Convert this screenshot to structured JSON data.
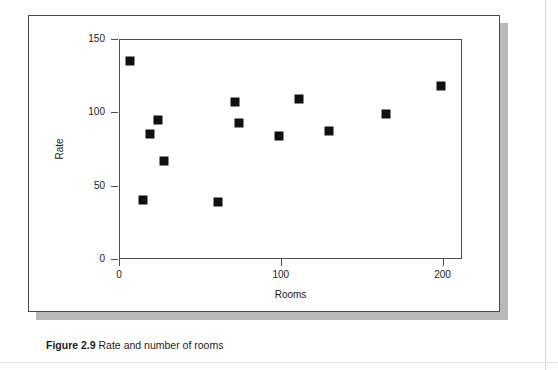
{
  "figure": {
    "caption_label": "Figure 2.9",
    "caption_text": "Rate and number of rooms"
  },
  "chart_data": {
    "type": "scatter",
    "title": "",
    "xlabel": "Rooms",
    "ylabel": "Rate",
    "xlim": [
      0,
      212
    ],
    "ylim": [
      0,
      150
    ],
    "xticks": [
      0,
      100,
      200
    ],
    "yticks": [
      0,
      50,
      100,
      150
    ],
    "xtick_labels": [
      "0",
      "100",
      "200"
    ],
    "ytick_labels": [
      "0",
      "50",
      "100",
      "150"
    ],
    "grid": false,
    "legend": null,
    "marker": "filled-square",
    "marker_color": "#111111",
    "series": [
      {
        "name": "hotels",
        "points": [
          {
            "x": 7,
            "y": 135
          },
          {
            "x": 15,
            "y": 40
          },
          {
            "x": 19,
            "y": 85
          },
          {
            "x": 24,
            "y": 95
          },
          {
            "x": 28,
            "y": 67
          },
          {
            "x": 61,
            "y": 39
          },
          {
            "x": 72,
            "y": 107
          },
          {
            "x": 74,
            "y": 93
          },
          {
            "x": 99,
            "y": 84
          },
          {
            "x": 111,
            "y": 109
          },
          {
            "x": 130,
            "y": 87
          },
          {
            "x": 165,
            "y": 99
          },
          {
            "x": 199,
            "y": 118
          }
        ]
      }
    ]
  },
  "colors": {
    "frame": "#4a4a4a",
    "axis": "#4d4d4d",
    "marker": "#111111",
    "shadow": "#b9b9b9",
    "page_rule": "#d8d8d8"
  }
}
